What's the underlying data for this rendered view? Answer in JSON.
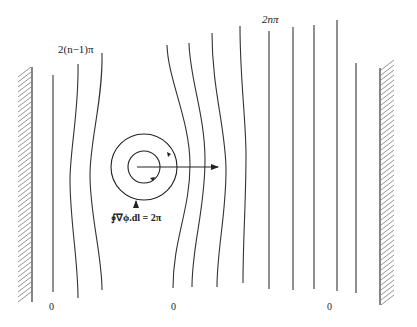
{
  "figure": {
    "top_labels": {
      "left": "2(n−1)π",
      "right": "2nπ"
    },
    "bottom_labels": [
      "0",
      "0",
      "0"
    ],
    "circulation_label": "∮∇ϕ.dl = 2π",
    "elements": {
      "walls": [
        "left-wall",
        "right-wall"
      ],
      "vortex": "two concentric circles with circulation arrows",
      "arrow": "horizontal arrow pointing right from vortex center",
      "contour_count": 12
    }
  }
}
